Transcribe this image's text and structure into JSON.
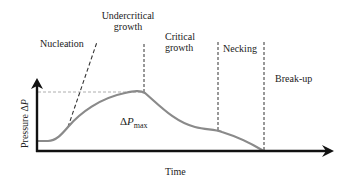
{
  "diagram": {
    "type": "process-stage-curve",
    "axes": {
      "x_label": "Time",
      "y_label_prefix": "Pressure Δ",
      "y_label_var": "P"
    },
    "stages": [
      {
        "label_line1": "Nucleation",
        "label_line2": ""
      },
      {
        "label_line1": "Undercritical",
        "label_line2": "growth"
      },
      {
        "label_line1": "Critical",
        "label_line2": "growth"
      },
      {
        "label_line1": "Necking",
        "label_line2": ""
      },
      {
        "label_line1": "Break-up",
        "label_line2": ""
      }
    ],
    "annotation": {
      "prefix": "Δ",
      "var": "P",
      "sub": "max"
    },
    "colors": {
      "curve": "#8a8a8a",
      "axis": "#111111",
      "dashed": "#333333",
      "reference_line": "#999999"
    }
  }
}
